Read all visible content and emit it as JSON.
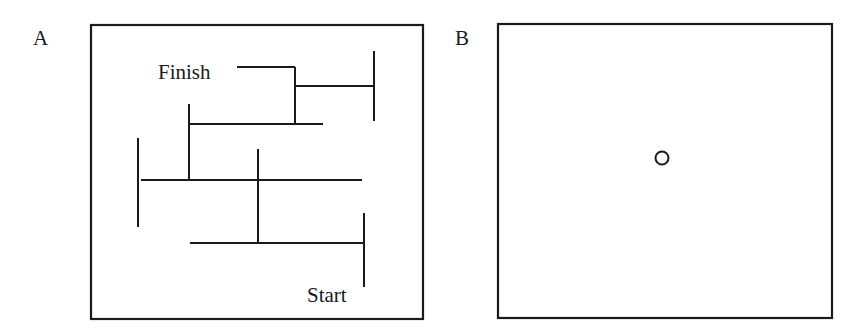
{
  "panels": [
    {
      "id": "A",
      "label": "A",
      "content": "maze",
      "start_label": "Start",
      "finish_label": "Finish",
      "frame": {
        "x": 91,
        "y": 25,
        "w": 332,
        "h": 294
      },
      "segments": [
        [
          237,
          67,
          295,
          67
        ],
        [
          295,
          67,
          295,
          124
        ],
        [
          296,
          86,
          374,
          86
        ],
        [
          374,
          51,
          374,
          121
        ],
        [
          190,
          124,
          323,
          124
        ],
        [
          189,
          104,
          189,
          181
        ],
        [
          141,
          180,
          362,
          180
        ],
        [
          138,
          138,
          138,
          227
        ],
        [
          258,
          149,
          258,
          243
        ],
        [
          190,
          243,
          364,
          243
        ],
        [
          364,
          213,
          364,
          287
        ]
      ],
      "finish_pos": [
        158,
        79
      ],
      "start_pos": [
        307,
        302
      ]
    },
    {
      "id": "B",
      "label": "B",
      "content": "empty-square-with-circle",
      "frame": {
        "x": 498,
        "y": 24,
        "w": 334,
        "h": 294
      },
      "circle": {
        "cx": 662,
        "cy": 158,
        "r": 6.5
      }
    }
  ],
  "colors": {
    "stroke": "#1a1a1a",
    "background": "#ffffff"
  }
}
